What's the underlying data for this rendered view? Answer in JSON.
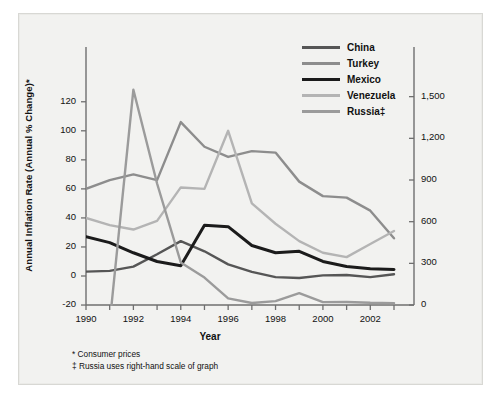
{
  "figure": {
    "background_color": "#f2f2f0",
    "border_color": "#d8d8d4"
  },
  "axes": {
    "ylabel": "Annual Inflation Rate (Annual % Change)*",
    "xlabel": "Year",
    "y_left_ticks": [
      "120",
      "100",
      "80",
      "60",
      "40",
      "20",
      "0",
      "-20"
    ],
    "y_left_values": [
      120,
      100,
      80,
      60,
      40,
      20,
      0,
      -20
    ],
    "y_right_ticks": [
      "1,500",
      "1,200",
      "900",
      "600",
      "300",
      "0"
    ],
    "y_right_values": [
      1500,
      1200,
      900,
      600,
      300,
      0
    ],
    "x_ticks": [
      "1990",
      "1992",
      "1994",
      "1996",
      "1998",
      "2000",
      "2002"
    ],
    "x_tick_values": [
      1990,
      1992,
      1994,
      1996,
      1998,
      2000,
      2002
    ]
  },
  "legend": {
    "position": "top-right",
    "entries": [
      {
        "label": "China",
        "color": "#565656"
      },
      {
        "label": "Turkey",
        "color": "#8d8d8d"
      },
      {
        "label": "Mexico",
        "color": "#1b1b1b"
      },
      {
        "label": "Venezuela",
        "color": "#b4b4b4"
      },
      {
        "label": "Russia‡",
        "color": "#9b9b9b"
      }
    ]
  },
  "footnotes": [
    "* Consumer prices",
    "‡ Russia uses right-hand scale of graph"
  ],
  "chart_data": {
    "type": "line",
    "title": "",
    "xlabel": "Year",
    "ylabel": "Annual Inflation Rate (Annual % Change)*",
    "grid": false,
    "legend_position": "top-right",
    "x": [
      1990,
      1991,
      1992,
      1993,
      1994,
      1995,
      1996,
      1997,
      1998,
      1999,
      2000,
      2001,
      2002,
      2003
    ],
    "xlim": [
      1990,
      2003
    ],
    "ylim": [
      -20,
      135
    ],
    "ylim_right": [
      0,
      1620
    ],
    "right_axis_note": "Russia uses right-hand scale of graph",
    "series": [
      {
        "name": "China",
        "color": "#565656",
        "axis": "left",
        "values": [
          3,
          3.5,
          6.5,
          15,
          24,
          17,
          8,
          2.8,
          -0.8,
          -1.4,
          0.4,
          0.7,
          -0.8,
          1.2
        ]
      },
      {
        "name": "Turkey",
        "color": "#8d8d8d",
        "axis": "left",
        "values": [
          60,
          66,
          70,
          66,
          106,
          89,
          82,
          86,
          85,
          65,
          55,
          54,
          45,
          26
        ]
      },
      {
        "name": "Mexico",
        "color": "#1b1b1b",
        "axis": "left",
        "values": [
          27,
          23,
          16,
          10,
          7,
          35,
          34,
          21,
          16,
          17,
          10,
          6.5,
          5,
          4.5
        ]
      },
      {
        "name": "Venezuela",
        "color": "#b4b4b4",
        "axis": "left",
        "values": [
          40,
          35,
          32,
          38,
          61,
          60,
          100,
          50,
          36,
          24,
          16,
          13,
          22,
          31
        ]
      },
      {
        "name": "Russia‡",
        "color": "#9b9b9b",
        "axis": "right",
        "values": [
          null,
          -130,
          1550,
          875,
          307,
          198,
          48,
          15,
          28,
          86,
          21,
          22,
          16,
          14
        ]
      }
    ],
    "annotations": [
      "Russia peaks in 1992 at roughly 1,550 percent on the right-hand scale",
      "Turkey peaks in 1994 near 106 percent",
      "Venezuela peaks in 1996 near 100 percent"
    ]
  }
}
